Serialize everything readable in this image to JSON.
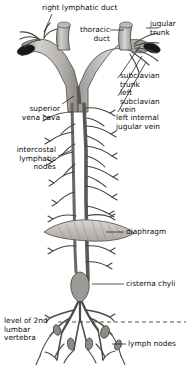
{
  "figure": {
    "background_color": "#ffffff",
    "ink_color": "#3c3c3c",
    "vessel_fill": "#b8b5b2",
    "vessel_fill_light": "#cfcccb",
    "lumen_color": "#161616",
    "labels": {
      "right_lymphatic_duct": "right lymphatic duct",
      "thoracic_duct": "thoracic\nduct",
      "jugular_trunk": "jugular\ntrunk",
      "subclavian_trunk": "subclavian\ntrunk",
      "left_subclavian_vein": "left\nsubclavian\nvein",
      "left_internal_jugular_vein": "left internal\njugular vein",
      "superior_vena_cava": "superior\nvena cava",
      "intercostal_lymphatic_nodes": "intercostal\nlymphatic\nnodes",
      "diaphragm": "diaphragm",
      "cisterna_chyli": "cisterna chyli",
      "level_of_2nd_lumbar_vertebra": "level of 2nd\nlumbar\nvertebra",
      "lymph_nodes": "lymph nodes"
    }
  }
}
